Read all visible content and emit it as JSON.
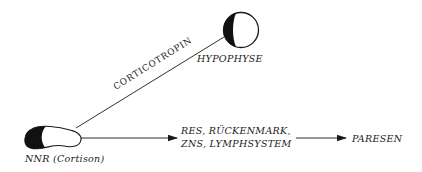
{
  "diagram": {
    "nodes": {
      "hypophyse": {
        "label": "HYPOPHYSE"
      },
      "nnr": {
        "label": "NNR (Cortison)"
      },
      "targets": {
        "line1": "RES, RÜCKENMARK,",
        "line2": "ZNS, LYMPHSYSTEM"
      },
      "outcome": {
        "label": "PARESEN"
      }
    },
    "edges": {
      "hypophyse_to_nnr": {
        "label": "CORTICOTROPIN"
      },
      "nnr_to_targets": {
        "label": ""
      },
      "targets_to_outcome": {
        "label": ""
      }
    },
    "colors": {
      "ink": "#1a1a1a",
      "background": "#ffffff"
    }
  }
}
